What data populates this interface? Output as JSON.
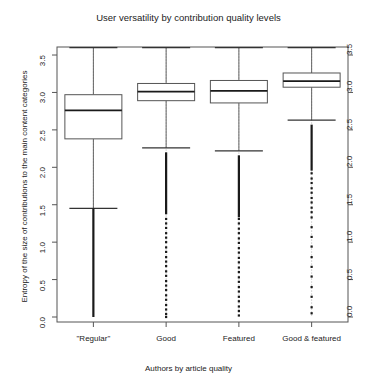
{
  "chart_data": {
    "type": "box",
    "title": "User versatility by contribution quality levels",
    "xlabel": "Authors by article quality",
    "ylabel": "Entropy of the size of contributions to the main content categories",
    "categories": [
      "\"Regular\"",
      "Good",
      "Featured",
      "Good & featured"
    ],
    "ylim": [
      0.0,
      3.6
    ],
    "yticks": [
      0.0,
      0.5,
      1.0,
      1.5,
      2.0,
      2.5,
      3.0,
      3.5
    ],
    "ytick_labels": [
      "0.0",
      "0.5",
      "1.0",
      "1.5",
      "2.0",
      "2.5",
      "3.0",
      "3.5"
    ],
    "yticks_right": [
      0.0,
      0.5,
      1.0,
      1.5,
      2.0,
      2.5,
      3.0,
      3.5
    ],
    "ytick_labels_right": [
      "0.0",
      "0.5",
      "1.0",
      "1.5",
      "2.0",
      "2.5",
      "3.0",
      "3.5"
    ],
    "grid": false,
    "legend": "none",
    "boxes": [
      {
        "label": "\"Regular\"",
        "whisker_high": 3.6,
        "q3": 2.97,
        "median": 2.76,
        "q1": 2.38,
        "whisker_low": 1.45,
        "outliers": [],
        "outlier_band_low": 0.0,
        "outlier_band_high": 1.45,
        "outlier_density": "none"
      },
      {
        "label": "Good",
        "whisker_high": 3.6,
        "q3": 3.12,
        "median": 3.01,
        "q1": 2.89,
        "whisker_low": 2.26,
        "outliers": [
          2.2,
          2.14,
          2.08,
          2.01,
          1.95,
          1.88,
          1.82,
          1.76,
          1.7,
          1.63,
          1.57,
          1.5,
          1.44,
          1.38,
          1.31,
          1.25,
          1.19,
          1.12,
          1.06,
          1.0,
          0.93,
          0.87,
          0.8,
          0.74,
          0.68,
          0.61,
          0.55,
          0.48,
          0.42,
          0.36,
          0.29,
          0.23,
          0.16,
          0.1,
          0.04,
          0.0
        ],
        "outlier_band_low": 0.0,
        "outlier_band_high": 2.2,
        "outlier_density": "dense"
      },
      {
        "label": "Featured",
        "whisker_high": 3.6,
        "q3": 3.16,
        "median": 3.02,
        "q1": 2.86,
        "whisker_low": 2.22,
        "outliers": [
          2.16,
          2.09,
          2.03,
          1.96,
          1.9,
          1.83,
          1.77,
          1.7,
          1.64,
          1.57,
          1.51,
          1.44,
          1.38,
          1.31,
          1.25,
          1.18,
          1.12,
          1.05,
          0.99,
          0.92,
          0.86,
          0.79,
          0.73,
          0.66,
          0.6,
          0.53,
          0.47,
          0.4,
          0.34,
          0.27,
          0.21,
          0.14,
          0.08,
          0.02
        ],
        "outlier_band_low": 0.02,
        "outlier_band_high": 2.16,
        "outlier_density": "dense"
      },
      {
        "label": "Good & featured",
        "whisker_high": 3.6,
        "q3": 3.26,
        "median": 3.15,
        "q1": 3.07,
        "whisker_low": 2.63,
        "outliers": [
          2.57,
          2.5,
          2.44,
          2.37,
          2.31,
          2.24,
          2.18,
          2.11,
          2.05,
          1.98,
          1.92,
          1.85,
          1.79,
          1.72,
          1.66,
          1.59,
          1.53,
          1.46,
          1.4,
          1.33,
          1.2,
          1.07,
          0.94,
          0.8,
          0.67,
          0.54,
          0.4,
          0.27,
          0.13,
          0.05
        ],
        "outlier_band_low": 0.05,
        "outlier_band_high": 2.57,
        "outlier_density": "medium"
      }
    ]
  }
}
